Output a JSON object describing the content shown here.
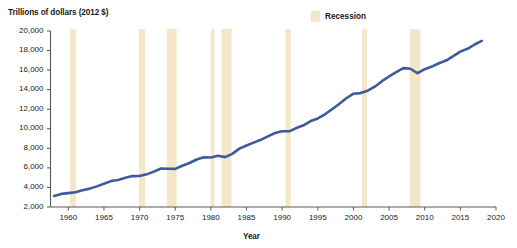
{
  "chart_data": {
    "type": "line",
    "title": "",
    "ylabel": "Trillions of dollars (2012 $)",
    "xlabel": "Year",
    "xlim": [
      1957.5,
      2020
    ],
    "ylim": [
      2000,
      20000
    ],
    "grid": false,
    "legend_position": "top-right",
    "legend": [
      {
        "name": "Recession",
        "color": "#f4e7c8",
        "type": "band"
      }
    ],
    "y_ticks": [
      2000,
      4000,
      6000,
      8000,
      10000,
      12000,
      14000,
      16000,
      18000,
      20000
    ],
    "y_tick_labels": [
      "2,000",
      "4,000",
      "6,000",
      "8,000",
      "10,000",
      "12,000",
      "14,000",
      "16,000",
      "18,000",
      "20,000"
    ],
    "x_ticks": [
      1960,
      1965,
      1970,
      1975,
      1980,
      1985,
      1990,
      1995,
      2000,
      2005,
      2010,
      2015,
      2020
    ],
    "x_tick_labels": [
      "1960",
      "1965",
      "1970",
      "1975",
      "1980",
      "1985",
      "1990",
      "1995",
      "2000",
      "2005",
      "2010",
      "2015",
      "2020"
    ],
    "series": [
      {
        "name": "Real GDP",
        "color": "#3d5a9e",
        "line_width": 2.6,
        "x": [
          1958,
          1959,
          1960,
          1961,
          1962,
          1963,
          1964,
          1965,
          1966,
          1967,
          1968,
          1969,
          1970,
          1971,
          1972,
          1973,
          1974,
          1975,
          1976,
          1977,
          1978,
          1979,
          1980,
          1981,
          1982,
          1983,
          1984,
          1985,
          1986,
          1987,
          1988,
          1989,
          1990,
          1991,
          1992,
          1993,
          1994,
          1995,
          1996,
          1997,
          1998,
          1999,
          2000,
          2001,
          2002,
          2003,
          2004,
          2005,
          2006,
          2007,
          2008,
          2009,
          2010,
          2011,
          2012,
          2013,
          2014,
          2015,
          2016,
          2017,
          2018
        ],
        "values": [
          3130,
          3340,
          3420,
          3500,
          3720,
          3880,
          4110,
          4370,
          4650,
          4770,
          5000,
          5160,
          5170,
          5340,
          5620,
          5940,
          5910,
          5900,
          6220,
          6500,
          6860,
          7080,
          7060,
          7240,
          7100,
          7430,
          7970,
          8290,
          8580,
          8870,
          9230,
          9570,
          9750,
          9740,
          10080,
          10360,
          10790,
          11060,
          11480,
          12000,
          12530,
          13120,
          13590,
          13650,
          13890,
          14300,
          14870,
          15350,
          15800,
          16200,
          16140,
          15680,
          16090,
          16360,
          16700,
          16980,
          17430,
          17890,
          18180,
          18620,
          19000
        ]
      }
    ],
    "recessions": [
      {
        "label": "1960-61",
        "start": 1960.25,
        "end": 1961.1
      },
      {
        "label": "1969-70",
        "start": 1969.9,
        "end": 1970.8
      },
      {
        "label": "1973-75",
        "start": 1973.8,
        "end": 1975.2
      },
      {
        "label": "1980",
        "start": 1980.0,
        "end": 1980.5
      },
      {
        "label": "1981-82",
        "start": 1981.5,
        "end": 1982.9
      },
      {
        "label": "1990-91",
        "start": 1990.5,
        "end": 1991.2
      },
      {
        "label": "2001",
        "start": 2001.2,
        "end": 2001.9
      },
      {
        "label": "2007-09",
        "start": 2007.9,
        "end": 2009.4
      }
    ]
  }
}
